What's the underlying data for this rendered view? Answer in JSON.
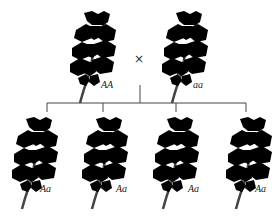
{
  "diagram": {
    "type": "genetic-cross",
    "parents": [
      {
        "genotype": "AA",
        "phenotype_color": "#555555",
        "label_x": 103,
        "label_y": 84
      },
      {
        "genotype": "aa",
        "phenotype_color": "#ffffff",
        "label_x": 195,
        "label_y": 84
      }
    ],
    "cross_symbol": "×",
    "offspring": [
      {
        "genotype": "Aa",
        "phenotype_color": "#d4d4d4"
      },
      {
        "genotype": "Aa",
        "phenotype_color": "#d4d4d4"
      },
      {
        "genotype": "Aa",
        "phenotype_color": "#d4d4d4"
      },
      {
        "genotype": "Aa",
        "phenotype_color": "#d4d4d4"
      }
    ],
    "outline_color": "#222222",
    "line_color": "#444444"
  }
}
